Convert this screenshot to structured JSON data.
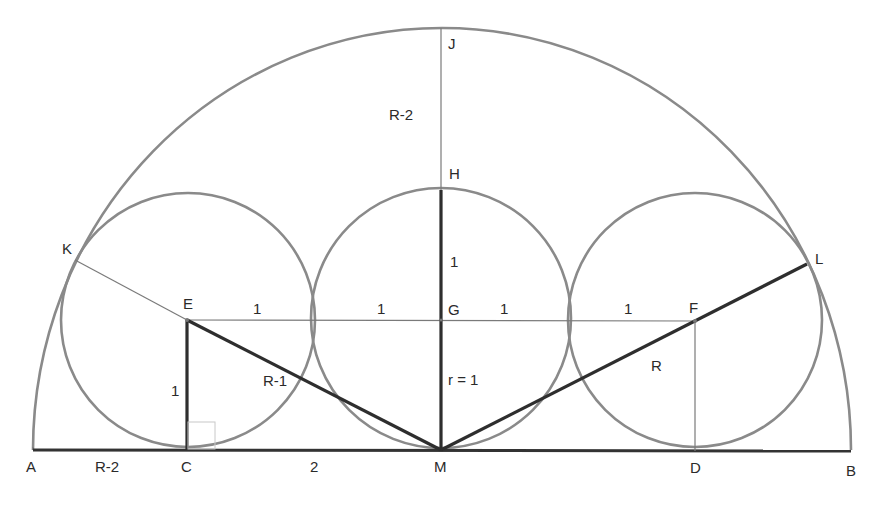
{
  "diagram": {
    "type": "geometry-construction",
    "colors": {
      "circle_stroke": "#8a8a8a",
      "thick_segment": "#2e2e2e",
      "thin_segment": "#7a7a7a",
      "background": "#ffffff"
    },
    "points": {
      "A": "A",
      "B": "B",
      "C": "C",
      "D": "D",
      "E": "E",
      "F": "F",
      "G": "G",
      "H": "H",
      "J": "J",
      "K": "K",
      "L": "L",
      "M": "M"
    },
    "segment_labels": {
      "AC": "R-2",
      "CM": "2",
      "HJ": "R-2",
      "GH": "1",
      "EC": "1",
      "EM": "R-1",
      "GM": "r = 1",
      "FM_L": "R",
      "EG_left": "1",
      "EG_right": "1",
      "GF_left": "1",
      "GF_right": "1"
    }
  }
}
